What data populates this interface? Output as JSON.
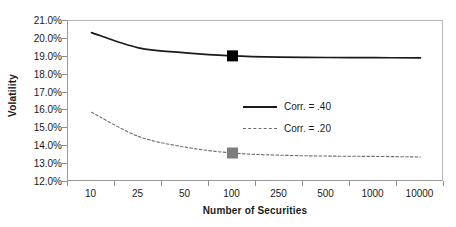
{
  "chart_data": {
    "type": "line",
    "title": "",
    "xlabel": "Number of Securities",
    "ylabel": "Volatility",
    "categories": [
      "10",
      "25",
      "50",
      "100",
      "250",
      "500",
      "1000",
      "10000"
    ],
    "ytick_labels": [
      "21.0%",
      "20.0%",
      "19.0%",
      "18.0%",
      "17.0%",
      "16.0%",
      "15.0%",
      "14.0%",
      "13.0%",
      "12.0%"
    ],
    "ylim": [
      12.0,
      21.0
    ],
    "ytick_step": 1.0,
    "grid": false,
    "legend_position": "inside-right",
    "series": [
      {
        "name": "Corr. = .40",
        "style": "solid",
        "color": "#1a1a1a",
        "values": [
          20.35,
          19.5,
          19.22,
          19.05,
          18.98,
          18.96,
          18.95,
          18.94
        ],
        "marker": {
          "category": "100",
          "value": 19.05,
          "shape": "square",
          "color": "#000000"
        }
      },
      {
        "name": "Corr. = .20",
        "style": "dashed",
        "color": "#6e6e6e",
        "values": [
          15.9,
          14.55,
          13.95,
          13.62,
          13.5,
          13.45,
          13.43,
          13.4
        ],
        "marker": {
          "category": "100",
          "value": 13.62,
          "shape": "square",
          "color": "#7d7d7d"
        }
      }
    ]
  },
  "colors": {
    "axis": "#9a9a9a",
    "text": "#1a1a1a",
    "series_40": "#1a1a1a",
    "series_20": "#6e6e6e",
    "marker_40": "#000000",
    "marker_20": "#7d7d7d",
    "background": "#ffffff"
  }
}
